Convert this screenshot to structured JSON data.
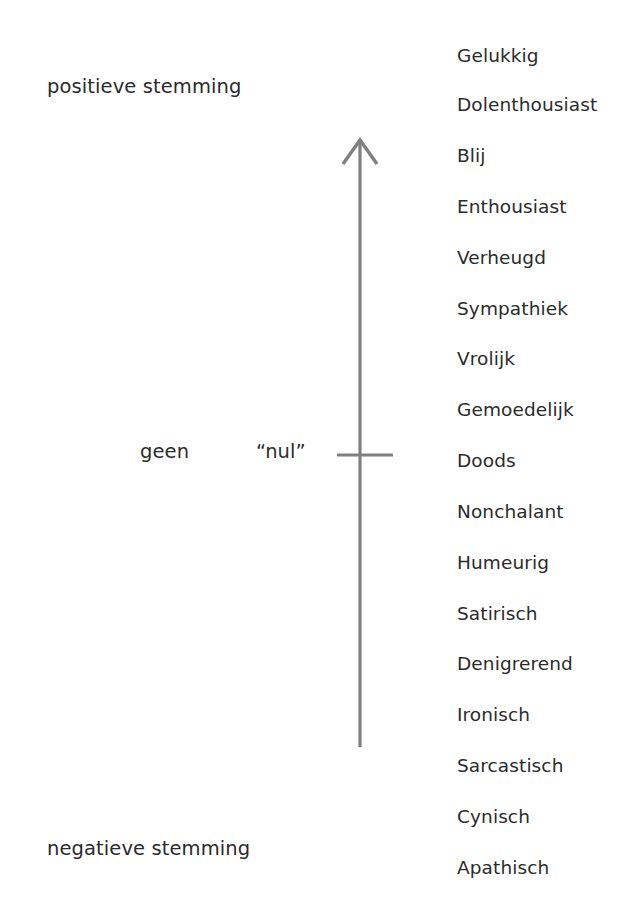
{
  "figure": {
    "background_color": "#ffffff",
    "text_color": "#2b2b2b",
    "axis_color": "#808080",
    "width": 638,
    "height": 912
  },
  "annotations": {
    "positive_pole": "positieve stemming",
    "negative_pole": "negatieve stemming",
    "zero_left": "geen",
    "zero_quoted": "“nul”"
  },
  "axis": {
    "orientation": "vertical",
    "arrow_head": "up",
    "arrow_style": "open-chevron",
    "top_y": 138,
    "bottom_y": 747,
    "x": 360,
    "tick": {
      "label": "nul",
      "y": 455,
      "x_start": 337,
      "x_end": 393
    }
  },
  "chart_data": {
    "type": "scatter",
    "title": "",
    "subtitle": "",
    "xlabel": "",
    "ylabel": "stemming",
    "grid": false,
    "legend": "none",
    "orientation": "vertical",
    "axis_direction": "positive up, negative down",
    "axis_poles": {
      "top": "positieve stemming",
      "bottom": "negatieve stemming",
      "middle": "geen / “nul”"
    },
    "categories": [
      "Gelukkig",
      "Dolenthousiast",
      "Blij",
      "Enthousiast",
      "Verheugd",
      "Sympathiek",
      "Vrolijk",
      "Gemoedelijk",
      "Doods",
      "Nonchalant",
      "Humeurig",
      "Satirisch",
      "Denigrerend",
      "Ironisch",
      "Sarcastisch",
      "Cynisch",
      "Apathisch"
    ],
    "values": [
      8,
      7,
      6,
      5,
      4,
      3,
      2,
      1,
      0,
      -1,
      -2,
      -3,
      -4,
      -5,
      -6,
      -7,
      -8
    ],
    "y_positions": [
      56,
      105,
      156,
      207,
      258,
      309,
      359,
      410,
      461,
      512,
      563,
      614,
      664,
      715,
      766,
      817,
      868
    ],
    "ylim": [
      -8,
      8
    ]
  }
}
